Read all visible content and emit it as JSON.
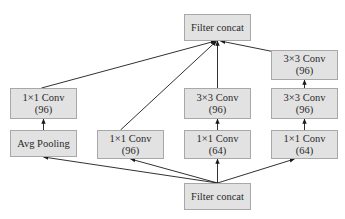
{
  "diagram": {
    "type": "inception-module",
    "nodes": {
      "output_concat": {
        "line1": "Filter concat"
      },
      "input_concat": {
        "line1": "Filter concat"
      },
      "b1_pool": {
        "line1": "Avg Pooling"
      },
      "b1_conv": {
        "line1": "1×1 Conv",
        "line2": "(96)"
      },
      "b2_conv": {
        "line1": "1×1 Conv",
        "line2": "(96)"
      },
      "b3_conv1": {
        "line1": "1×1 Conv",
        "line2": "(64)"
      },
      "b3_conv3": {
        "line1": "3×3 Conv",
        "line2": "(96)"
      },
      "b4_conv1": {
        "line1": "1×1 Conv",
        "line2": "(64)"
      },
      "b4_conv3a": {
        "line1": "3×3 Conv",
        "line2": "(96)"
      },
      "b4_conv3b": {
        "line1": "3×3 Conv",
        "line2": "(96)"
      }
    },
    "edges": [
      {
        "from": "input_concat",
        "to": "b1_pool"
      },
      {
        "from": "input_concat",
        "to": "b2_conv"
      },
      {
        "from": "input_concat",
        "to": "b3_conv1"
      },
      {
        "from": "input_concat",
        "to": "b4_conv1"
      },
      {
        "from": "b1_pool",
        "to": "b1_conv"
      },
      {
        "from": "b3_conv1",
        "to": "b3_conv3"
      },
      {
        "from": "b4_conv1",
        "to": "b4_conv3a"
      },
      {
        "from": "b4_conv3a",
        "to": "b4_conv3b"
      },
      {
        "from": "b1_conv",
        "to": "output_concat"
      },
      {
        "from": "b2_conv",
        "to": "output_concat"
      },
      {
        "from": "b3_conv3",
        "to": "output_concat"
      },
      {
        "from": "b4_conv3b",
        "to": "output_concat"
      }
    ],
    "colors": {
      "node_fill": "#e2e2e2",
      "node_border": "#a8a8a8",
      "edge": "#1a1a1a"
    }
  }
}
